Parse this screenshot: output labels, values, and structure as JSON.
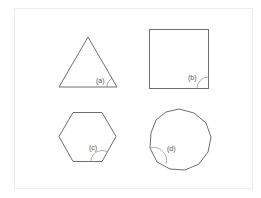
{
  "diagram": {
    "title": "",
    "frame_color": "#ececec",
    "stroke_color": "#6e6e6e",
    "shapes": [
      {
        "id": "a",
        "name": "equilateral-triangle",
        "sides": 3,
        "label": "(a)",
        "angle_marked": "interior angle at bottom-right vertex"
      },
      {
        "id": "b",
        "name": "square",
        "sides": 4,
        "label": "(b)",
        "angle_marked": "interior angle at bottom-right corner"
      },
      {
        "id": "c",
        "name": "regular-hexagon",
        "sides": 6,
        "label": "(c)",
        "angle_marked": "interior angle at bottom-right vertex"
      },
      {
        "id": "d",
        "name": "regular-hendecagon",
        "sides": 11,
        "label": "(d)",
        "angle_marked": "interior angle at lower-left vertex"
      }
    ]
  }
}
